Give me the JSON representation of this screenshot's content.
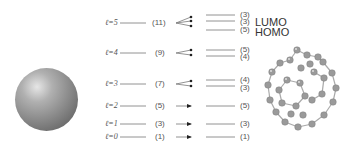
{
  "diagram": {
    "type": "energy-level-splitting",
    "left_model": "sphere",
    "right_model": "fullerene-molecule",
    "levels": [
      {
        "l_label": "ℓ=5",
        "degeneracy": "(11)",
        "split": [
          "(3)",
          "(3)",
          "(5)"
        ],
        "y": 18
      },
      {
        "l_label": "ℓ=4",
        "degeneracy": "(9)",
        "split": [
          "(5)",
          "(4)"
        ],
        "y": 53
      },
      {
        "l_label": "ℓ=3",
        "degeneracy": "(7)",
        "split": [
          "(4)",
          "(3)"
        ],
        "y": 83
      },
      {
        "l_label": "ℓ=2",
        "degeneracy": "(5)",
        "split": [
          "(5)"
        ],
        "y": 105
      },
      {
        "l_label": "ℓ=1",
        "degeneracy": "(3)",
        "split": [
          "(3)"
        ],
        "y": 122
      },
      {
        "l_label": "ℓ=0",
        "degeneracy": "(1)",
        "split": [
          "(1)"
        ],
        "y": 136
      }
    ],
    "annotations": {
      "lumo": "LUMO",
      "homo": "HOMO"
    }
  }
}
